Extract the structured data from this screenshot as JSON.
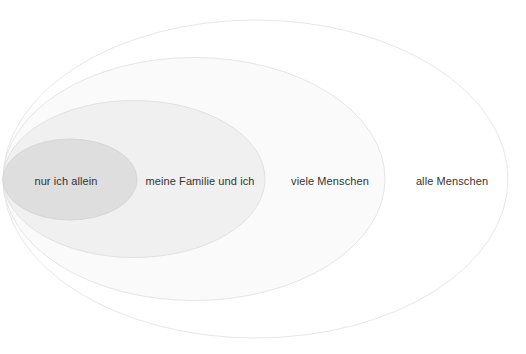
{
  "diagram": {
    "type": "euler-nested-ellipses",
    "title": "",
    "background_color": "#ffffff",
    "text_color": "#333333",
    "canvas": {
      "width": 526,
      "height": 354
    },
    "ellipses": [
      {
        "id": "alle-menschen",
        "label": "alle Menschen",
        "order": 4,
        "cx": 255.5,
        "cy": 179,
        "rx": 252.5,
        "ry": 159,
        "fill": "#ffffff",
        "stroke": "#e8e8e8",
        "stroke_width": 1,
        "label_x": 452,
        "label_y": 181
      },
      {
        "id": "viele-menschen",
        "label": "viele Menschen",
        "order": 3,
        "cx": 194,
        "cy": 179,
        "rx": 191,
        "ry": 121.5,
        "fill": "#fafafa",
        "stroke": "#e6e6e6",
        "stroke_width": 1,
        "label_x": 330,
        "label_y": 181
      },
      {
        "id": "meine-familie-und-ich",
        "label": "meine Familie und ich",
        "order": 2,
        "cx": 134,
        "cy": 179,
        "rx": 131,
        "ry": 78.5,
        "fill": "#f0f0f0",
        "stroke": "#e2e2e2",
        "stroke_width": 1,
        "label_x": 200,
        "label_y": 181
      },
      {
        "id": "nur-ich-allein",
        "label": "nur ich allein",
        "order": 1,
        "cx": 70,
        "cy": 179.5,
        "rx": 67,
        "ry": 40.5,
        "fill": "#dedede",
        "stroke": "#d6d6d6",
        "stroke_width": 1,
        "label_x": 66,
        "label_y": 181
      }
    ]
  }
}
